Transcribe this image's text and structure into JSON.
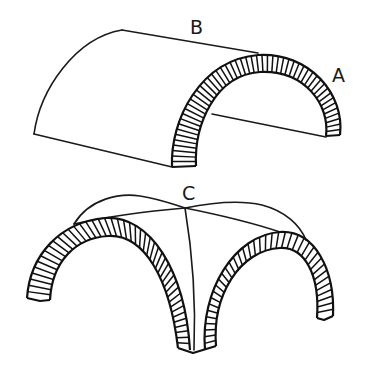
{
  "figure": {
    "background": "#ffffff",
    "line_color": "#1a1a1a",
    "top": {
      "name": "barrel-vault",
      "labels": [
        {
          "id": "B",
          "text": "B",
          "x": 190,
          "y": 34
        },
        {
          "id": "A",
          "text": "A",
          "x": 332,
          "y": 82
        }
      ]
    },
    "bottom": {
      "name": "groin-vault",
      "labels": [
        {
          "id": "C",
          "text": "C",
          "x": 182,
          "y": 200
        }
      ]
    }
  }
}
